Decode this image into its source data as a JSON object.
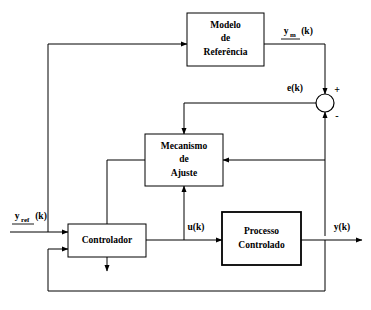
{
  "diagram": {
    "type": "block-diagram",
    "background_color": "#ffffff",
    "line_color": "#000000",
    "blocks": [
      {
        "id": "modelo-referencia",
        "lines": [
          "Modelo",
          "de",
          "Referência"
        ],
        "x": 187,
        "y": 13,
        "width": 77,
        "height": 53,
        "border": "thin"
      },
      {
        "id": "mecanismo-ajuste",
        "lines": [
          "Mecanismo",
          "de",
          "Ajuste"
        ],
        "x": 145,
        "y": 134,
        "width": 78,
        "height": 52,
        "border": "thin"
      },
      {
        "id": "controlador",
        "lines": [
          "Controlador"
        ],
        "x": 68,
        "y": 224,
        "width": 78,
        "height": 33,
        "border": "thin"
      },
      {
        "id": "processo-controlado",
        "lines": [
          "Processo",
          "Controlado"
        ],
        "x": 222,
        "y": 212,
        "width": 79,
        "height": 53,
        "border": "thick"
      }
    ],
    "junction": {
      "id": "somador",
      "cx": 325,
      "cy": 103,
      "r": 9,
      "plus_sign": "+",
      "minus_sign": "-"
    },
    "signals": {
      "reference_input": {
        "base": "y",
        "sub": "ref",
        "tail": "(k)",
        "text": "y_ref(k)"
      },
      "model_output": {
        "base": "y",
        "sub": "m",
        "tail": "(k)",
        "text": "y_m(k)"
      },
      "error": {
        "text": "e(k)"
      },
      "control_action": {
        "text": "u(k)"
      },
      "plant_output": {
        "text": "y(k)"
      }
    }
  }
}
